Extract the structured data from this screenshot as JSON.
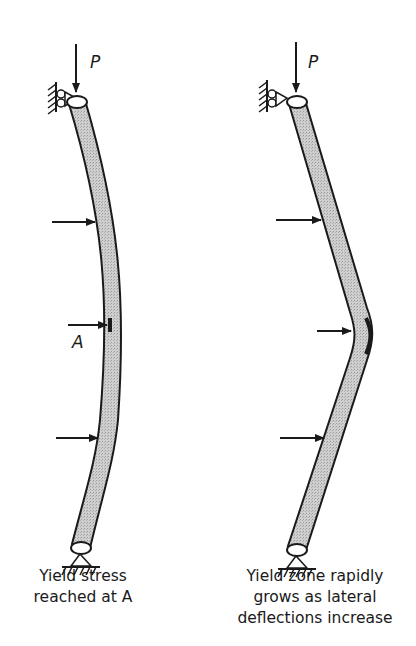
{
  "figure": {
    "left_panel": {
      "load_label": "P",
      "point_label": "A",
      "caption_line1": "Yield stress",
      "caption_line2": "reached at A"
    },
    "right_panel": {
      "load_label": "P",
      "caption_line1": "Yield zone rapidly",
      "caption_line2": "grows as lateral",
      "caption_line3": "deflections increase"
    },
    "colors": {
      "ink": "#1a1a1a",
      "column_fill": "#c8c8c8",
      "background": "#ffffff"
    }
  }
}
